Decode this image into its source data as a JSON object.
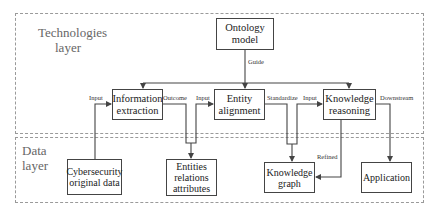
{
  "layers": {
    "technologies": {
      "title": "Technologies\nlayer"
    },
    "data": {
      "title": "Data\nlayer"
    }
  },
  "nodes": {
    "ontology": "Ontology\nmodel",
    "info_extraction": "Information\nextraction",
    "entity_alignment": "Entity\nalignment",
    "knowledge_reasoning": "Knowledge\nreasoning",
    "cyber_data": "Cybersecurity\noriginal data",
    "entities": "Entities\nrelations\nattributes",
    "knowledge_graph": "Knowledge\ngraph",
    "application": "Application"
  },
  "edge_labels": {
    "guide": "Guide",
    "input1": "Input",
    "outcome": "Outcome",
    "input2": "Input",
    "standardize": "Standardize",
    "input3": "Input",
    "downstream": "Downstream",
    "refined": "Refined"
  },
  "colors": {
    "line": "#444444",
    "dashed": "#9a9a9a"
  }
}
